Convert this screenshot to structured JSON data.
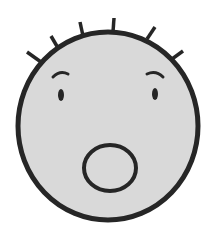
{
  "illustration": {
    "subject": "surprised face",
    "colors": {
      "background": "#ffffff",
      "face_fill": "#d9d9d9",
      "stroke": "#262626"
    },
    "face": {
      "cx": 108,
      "cy": 126,
      "rx": 90,
      "ry": 94,
      "stroke_width": 5
    },
    "hair_strokes": [
      {
        "x1": 27,
        "y1": 52,
        "x2": 41,
        "y2": 62
      },
      {
        "x1": 51,
        "y1": 36,
        "x2": 58,
        "y2": 48
      },
      {
        "x1": 80,
        "y1": 22,
        "x2": 83,
        "y2": 36
      },
      {
        "x1": 114,
        "y1": 18,
        "x2": 113,
        "y2": 32
      },
      {
        "x1": 155,
        "y1": 27,
        "x2": 147,
        "y2": 39
      },
      {
        "x1": 183,
        "y1": 51,
        "x2": 172,
        "y2": 59
      }
    ],
    "eyebrows": {
      "left": "M53 77 Q60 70 68 74",
      "right": "M147 74 Q156 70 163 77"
    },
    "eyes": {
      "left": {
        "cx": 61,
        "cy": 95,
        "rx": 3,
        "ry": 6
      },
      "right": {
        "cx": 155,
        "cy": 94,
        "rx": 3,
        "ry": 6
      }
    },
    "mouth": {
      "cx": 110,
      "cy": 168,
      "rx": 26,
      "ry": 23,
      "stroke_width": 4
    }
  }
}
